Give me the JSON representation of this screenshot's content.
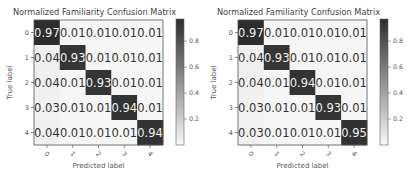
{
  "chart_data": [
    {
      "type": "heatmap",
      "title": "Normalized Familiarity Confusion Matrix",
      "xlabel": "Predicted label",
      "ylabel": "True label",
      "x_ticks": [
        "0",
        "1",
        "2",
        "3",
        "4"
      ],
      "y_ticks": [
        "0",
        "1",
        "2",
        "3",
        "4"
      ],
      "values": [
        [
          0.97,
          0.01,
          0.01,
          0.01,
          0.01
        ],
        [
          0.04,
          0.93,
          0.01,
          0.01,
          0.01
        ],
        [
          0.04,
          0.01,
          0.93,
          0.01,
          0.01
        ],
        [
          0.03,
          0.01,
          0.01,
          0.94,
          0.01
        ],
        [
          0.04,
          0.01,
          0.01,
          0.01,
          0.94
        ]
      ],
      "labels": [
        [
          "0.97",
          "0.01",
          "0.01",
          "0.01",
          "0.01"
        ],
        [
          "0.04",
          "0.93",
          "0.01",
          "0.01",
          "0.01"
        ],
        [
          "0.04",
          "0.01",
          "0.93",
          "0.01",
          "0.01"
        ],
        [
          "0.03",
          "0.01",
          "0.01",
          "0.94",
          "0.01"
        ],
        [
          "0.04",
          "0.01",
          "0.01",
          "0.01",
          "0.94"
        ]
      ],
      "colorbar": {
        "range": [
          0.0,
          0.97
        ],
        "ticks": [
          "0.2",
          "0.4",
          "0.6",
          "0.8"
        ],
        "tick_values": [
          0.2,
          0.4,
          0.6,
          0.8
        ],
        "colormap": "Greys"
      }
    },
    {
      "type": "heatmap",
      "title": "Normalized Familiarity Confusion Matrix",
      "xlabel": "Predicted label",
      "ylabel": "True label",
      "x_ticks": [
        "0",
        "1",
        "2",
        "3",
        "4"
      ],
      "y_ticks": [
        "0",
        "1",
        "2",
        "3",
        "4"
      ],
      "values": [
        [
          0.97,
          0.01,
          0.01,
          0.01,
          0.01
        ],
        [
          0.04,
          0.93,
          0.01,
          0.01,
          0.01
        ],
        [
          0.04,
          0.01,
          0.94,
          0.01,
          0.01
        ],
        [
          0.03,
          0.01,
          0.01,
          0.93,
          0.01
        ],
        [
          0.03,
          0.01,
          0.01,
          0.01,
          0.95
        ]
      ],
      "labels": [
        [
          "0.97",
          "0.01",
          "0.01",
          "0.01",
          "0.01"
        ],
        [
          "0.04",
          "0.93",
          "0.01",
          "0.01",
          "0.01"
        ],
        [
          "0.04",
          "0.01",
          "0.94",
          "0.01",
          "0.01"
        ],
        [
          "0.03",
          "0.01",
          "0.01",
          "0.93",
          "0.01"
        ],
        [
          "0.03",
          "0.01",
          "0.01",
          "0.01",
          "0.95"
        ]
      ],
      "colorbar": {
        "range": [
          0.0,
          0.97
        ],
        "ticks": [
          "0.2",
          "0.4",
          "0.6",
          "0.8"
        ],
        "tick_values": [
          0.2,
          0.4,
          0.6,
          0.8
        ],
        "colormap": "Greys"
      }
    }
  ]
}
